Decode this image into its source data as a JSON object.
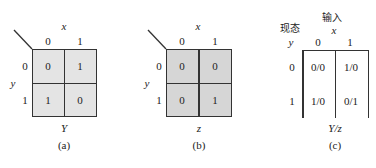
{
  "figures": {
    "a": {
      "col_var": "x",
      "row_var": "y",
      "col_headers": [
        "0",
        "1"
      ],
      "row_headers": [
        "0",
        "1"
      ],
      "cells": [
        [
          "0",
          "1"
        ],
        [
          "1",
          "0"
        ]
      ],
      "output_label": "Y",
      "caption": "(a)",
      "fill": "#e4e4e4"
    },
    "b": {
      "col_var": "x",
      "row_var": "y",
      "col_headers": [
        "0",
        "1"
      ],
      "row_headers": [
        "0",
        "1"
      ],
      "cells": [
        [
          "0",
          "0"
        ],
        [
          "0",
          "1"
        ]
      ],
      "output_label": "z",
      "caption": "(b)",
      "fill": "#d6d6d6"
    },
    "c": {
      "input_title": "输入",
      "state_title": "现态",
      "col_var": "x",
      "row_var": "y",
      "col_headers": [
        "0",
        "1"
      ],
      "row_headers": [
        "0",
        "1"
      ],
      "cells": [
        [
          "0/0",
          "1/0"
        ],
        [
          "1/0",
          "0/1"
        ]
      ],
      "output_label": "Y/z",
      "caption": "(c)"
    }
  }
}
